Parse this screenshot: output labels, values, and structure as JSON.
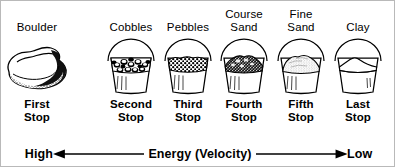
{
  "figure": {
    "ink_color": "#000000",
    "background": "#ffffff",
    "border_color": "#b9b9b9"
  },
  "columns": [
    {
      "size_label": "Boulder",
      "stop_label": "First\nStop",
      "art": "boulder-rock",
      "grain": "boulder"
    },
    {
      "size_label": "Cobbles",
      "stop_label": "Second\nStop",
      "art": "bucket-with-cobbles",
      "grain": "cobbles"
    },
    {
      "size_label": "Pebbles",
      "stop_label": "Third\nStop",
      "art": "bucket-with-pebbles",
      "grain": "pebbles"
    },
    {
      "size_label": "Course\nSand",
      "stop_label": "Fourth\nStop",
      "art": "bucket-with-coarse-sand",
      "grain": "coarse-sand"
    },
    {
      "size_label": "Fine\nSand",
      "stop_label": "Fifth\nStop",
      "art": "bucket-with-fine-sand",
      "grain": "fine-sand"
    },
    {
      "size_label": "Clay",
      "stop_label": "Last\nStop",
      "art": "bucket-with-clay",
      "grain": "clay"
    }
  ],
  "axis": {
    "left_label": "High",
    "center_label": "Energy (Velocity)",
    "right_label": "Low",
    "left_arrow": "arrow-left",
    "right_arrow": "arrow-right"
  }
}
